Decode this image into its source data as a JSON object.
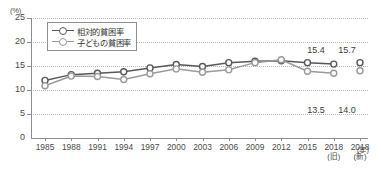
{
  "chart_data": {
    "type": "line",
    "title": "",
    "xlabel": "(年)",
    "ylabel": "(%)",
    "ylim": [
      0,
      25
    ],
    "yticks": [
      0,
      5,
      10,
      15,
      20,
      25
    ],
    "grid": true,
    "legend_position": "top-left",
    "categories": [
      "1985",
      "1988",
      "1991",
      "1994",
      "1997",
      "2000",
      "2003",
      "2006",
      "2009",
      "2012",
      "2015",
      "2018",
      "2018"
    ],
    "category_sublabels": [
      "",
      "",
      "",
      "",
      "",
      "",
      "",
      "",
      "",
      "",
      "",
      "(旧)",
      "(新)"
    ],
    "series": [
      {
        "name": "相対的貧困率",
        "color": "#585858",
        "values": [
          12.0,
          13.2,
          13.5,
          13.8,
          14.6,
          15.3,
          14.9,
          15.7,
          16.0,
          16.1,
          15.7,
          15.4,
          15.7
        ],
        "end_label_old": "15.4",
        "end_label_new": "15.7"
      },
      {
        "name": "子どもの貧困率",
        "color": "#9a9a9a",
        "values": [
          10.9,
          12.9,
          12.8,
          12.2,
          13.4,
          14.4,
          13.7,
          14.2,
          15.7,
          16.3,
          13.9,
          13.5,
          14.0
        ],
        "end_label_old": "13.5",
        "end_label_new": "14.0"
      }
    ],
    "annotations": [
      {
        "text": "15.4",
        "series": "相対的貧困率",
        "at": "2018(旧)"
      },
      {
        "text": "15.7",
        "series": "相対的貧困率",
        "at": "2018(新)"
      },
      {
        "text": "13.5",
        "series": "子どもの貧困率",
        "at": "2018(旧)"
      },
      {
        "text": "14.0",
        "series": "子どもの貧困率",
        "at": "2018(新)"
      }
    ]
  },
  "axis": {
    "y_unit": "(%)",
    "x_unit": "(年)",
    "yticks": [
      "25",
      "20",
      "15",
      "10",
      "5",
      "0"
    ]
  },
  "legend": {
    "items": [
      {
        "label": "相対的貧困率"
      },
      {
        "label": "子どもの貧困率"
      }
    ]
  },
  "value_labels": {
    "top_old": "15.4",
    "top_new": "15.7",
    "bottom_old": "13.5",
    "bottom_new": "14.0"
  }
}
